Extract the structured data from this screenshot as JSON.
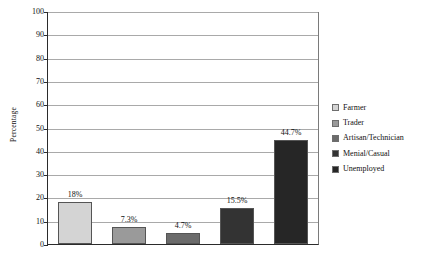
{
  "chart_data": {
    "type": "bar",
    "title": "",
    "subtitle": "",
    "xlabel": "",
    "ylabel": "Percentage",
    "categories": [
      "Farmer",
      "Trader",
      "Artisan/Technician",
      "Menial/Casual",
      "Unemployed"
    ],
    "values": [
      18,
      7.3,
      4.7,
      15.5,
      44.7
    ],
    "data_labels": [
      "18%",
      "7.3%",
      "4.7%",
      "15.5%",
      "44.7%"
    ],
    "colors": [
      "#d4d4d4",
      "#9a9a9a",
      "#6b6b6b",
      "#333333",
      "#262626"
    ],
    "ylim": [
      0,
      100
    ],
    "y_ticks": [
      0,
      10,
      20,
      30,
      40,
      50,
      60,
      70,
      80,
      90,
      100
    ],
    "y_tick_labels": [
      "0",
      "10",
      "20",
      "30",
      "40",
      "50",
      "60",
      "70",
      "80",
      "90",
      "100"
    ],
    "x_tick_labels": [
      "",
      "",
      "",
      "",
      ""
    ],
    "grid": true,
    "grid_axis": "y",
    "legend_position": "right",
    "legend": [
      {
        "label": "Farmer",
        "color": "#d4d4d4"
      },
      {
        "label": "Trader",
        "color": "#9a9a9a"
      },
      {
        "label": "Artisan/Technician",
        "color": "#6b6b6b"
      },
      {
        "label": "Menial/Casual",
        "color": "#333333"
      },
      {
        "label": "Unemployed",
        "color": "#262626"
      }
    ]
  }
}
